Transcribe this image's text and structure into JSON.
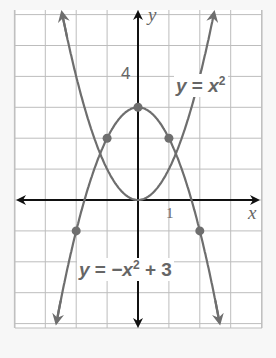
{
  "graph": {
    "x_axis_label": "x",
    "y_axis_label": "y",
    "tick_labels": {
      "x_1": "1",
      "y_4": "4"
    },
    "x_range": [
      -4,
      4
    ],
    "y_range": [
      -4,
      6
    ],
    "colors": {
      "grid": "#bdbdbd",
      "axis": "#111111",
      "curve": "#6e6e6e",
      "point": "#6e6e6e",
      "background": "#ffffff"
    }
  },
  "curves": [
    {
      "name": "parabola-up",
      "equation_y": "y",
      "equation_eq": "=",
      "equation_base": "x",
      "equation_exp": "2",
      "points": [
        [
          -1,
          1
        ],
        [
          0,
          0
        ],
        [
          1,
          1
        ]
      ]
    },
    {
      "name": "parabola-down",
      "equation_y": "y",
      "equation_eq": "=",
      "equation_rest": "−x",
      "equation_exp": "2",
      "equation_tail": "+ 3",
      "points": [
        [
          -2,
          -1
        ],
        [
          -1,
          2
        ],
        [
          0,
          3
        ],
        [
          1,
          2
        ],
        [
          2,
          -1
        ]
      ]
    }
  ]
}
